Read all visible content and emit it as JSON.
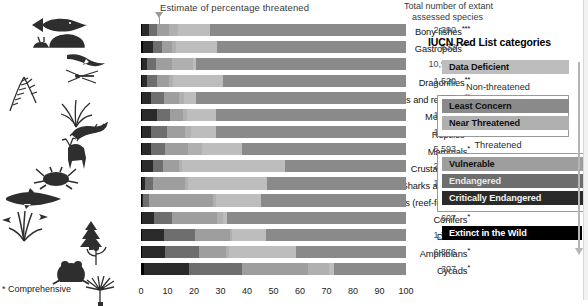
{
  "chart_title": "Estimate of percentage threatened",
  "totals_header_line1": "Total number of extant",
  "totals_header_line2": "assessed species",
  "footnote": "* Comprehensive",
  "legend": {
    "title": "IUCN Red List categories",
    "data_deficient": "Data Deficient",
    "non_threatened_label": "Non-threatened",
    "least_concern": "Least Concern",
    "near_threatened": "Near Threatened",
    "threatened_label": "Threatened",
    "vulnerable": "Vulnerable",
    "endangered": "Endangered",
    "critically_endangered": "Critically Endangered",
    "extinct_in_the_wild": "Extinct in the Wild"
  },
  "colors": {
    "data_deficient": "#bdbdbd",
    "least_concern": "#8a8a8a",
    "near_threatened": "#b0b0b0",
    "vulnerable": "#9e9e9e",
    "endangered": "#6e6e6e",
    "critically_endangered": "#2a2a2a",
    "extinct_in_the_wild": "#000000",
    "marker": "#9a9a9a",
    "background": "#ffffff"
  },
  "chart_data": {
    "type": "bar",
    "orientation": "horizontal",
    "stacked": true,
    "normalized_percent": true,
    "title": "Estimate of percentage threatened",
    "xlabel": "",
    "ylabel": "",
    "xlim": [
      0,
      100
    ],
    "xticks": [
      0,
      10,
      20,
      30,
      40,
      50,
      60,
      70,
      80,
      90,
      100
    ],
    "grid": false,
    "legend_position": "right",
    "threat_marker_percent": 7,
    "series": [
      {
        "name": "Extinct in the Wild",
        "key": "ew",
        "color": "#000000"
      },
      {
        "name": "Critically Endangered",
        "key": "cr",
        "color": "#2a2a2a"
      },
      {
        "name": "Endangered",
        "key": "en",
        "color": "#6e6e6e"
      },
      {
        "name": "Vulnerable",
        "key": "vu",
        "color": "#9e9e9e"
      },
      {
        "name": "Near Threatened",
        "key": "nt",
        "color": "#b0b0b0"
      },
      {
        "name": "Data Deficient",
        "key": "dd",
        "color": "#d6d6d6"
      },
      {
        "name": "Least Concern",
        "key": "lc",
        "color": "#8a8a8a"
      }
    ],
    "categories": [
      "Bony fishes",
      "Gastropods",
      "Birds",
      "Dragonflies",
      "Ferns and relatives",
      "Monocots",
      "Reptiles",
      "Mammals",
      "Crustaceans",
      "Sharks and rays",
      "Corals (reef-forming)",
      "Conifers",
      "Dicots",
      "Amphibians",
      "Cycads"
    ],
    "rows": [
      {
        "label": "Bony fishes",
        "stars": "***",
        "total": "2,390",
        "ew": 0.4,
        "cr": 2.5,
        "en": 3.0,
        "vu": 4.5,
        "nt": 3.5,
        "dd": 12.0,
        "lc": 74.1
      },
      {
        "label": "Gastropods",
        "stars": "***",
        "total": "633",
        "ew": 0.6,
        "cr": 4.0,
        "en": 3.5,
        "vu": 3.5,
        "nt": 1.5,
        "dd": 15.5,
        "lc": 71.4
      },
      {
        "label": "Birds",
        "stars": "*",
        "total": "10,966",
        "ew": 0.3,
        "cr": 1.8,
        "en": 3.6,
        "vu": 6.0,
        "nt": 8.0,
        "dd": 1.0,
        "lc": 79.3
      },
      {
        "label": "Dragonflies",
        "stars": "**",
        "total": "1,520",
        "ew": 0.2,
        "cr": 2.0,
        "en": 3.8,
        "vu": 4.5,
        "nt": 1.5,
        "dd": 19.0,
        "lc": 69.0
      },
      {
        "label": "Ferns and relatives",
        "stars": "**",
        "total": "972",
        "ew": 0.3,
        "cr": 3.5,
        "en": 5.0,
        "vu": 5.5,
        "nt": 2.0,
        "dd": 4.5,
        "lc": 79.2
      },
      {
        "label": "Monocots",
        "stars": "**",
        "total": "1,026",
        "ew": 0.5,
        "cr": 5.5,
        "en": 5.0,
        "vu": 5.0,
        "nt": 1.5,
        "dd": 11.0,
        "lc": 71.5
      },
      {
        "label": "Reptiles",
        "stars": "**",
        "total": "1,500",
        "ew": 0.3,
        "cr": 3.5,
        "en": 6.0,
        "vu": 7.0,
        "nt": 2.0,
        "dd": 9.5,
        "lc": 71.7
      },
      {
        "label": "Mammals",
        "stars": "*",
        "total": "5,593",
        "ew": 0.2,
        "cr": 3.5,
        "en": 5.5,
        "vu": 8.5,
        "nt": 5.5,
        "dd": 15.0,
        "lc": 61.8
      },
      {
        "label": "Crustaceans",
        "stars": "***",
        "total": "2,872",
        "ew": 0.4,
        "cr": 4.0,
        "en": 4.0,
        "vu": 6.0,
        "nt": 1.0,
        "dd": 39.0,
        "lc": 45.6
      },
      {
        "label": "Sharks and rays",
        "stars": "*",
        "total": "1,091",
        "ew": 0.2,
        "cr": 1.5,
        "en": 3.0,
        "vu": 12.0,
        "nt": 1.0,
        "dd": 30.0,
        "lc": 52.3
      },
      {
        "label": "Corals (reef-forming)",
        "stars": "*",
        "total": "845",
        "ew": 0.2,
        "cr": 0.5,
        "en": 2.5,
        "vu": 24.0,
        "nt": 1.0,
        "dd": 17.0,
        "lc": 54.8
      },
      {
        "label": "Conifers",
        "stars": "*",
        "total": "607",
        "ew": 0.3,
        "cr": 4.5,
        "en": 7.0,
        "vu": 17.0,
        "nt": 2.0,
        "dd": 1.5,
        "lc": 67.7
      },
      {
        "label": "Dicots",
        "stars": "***",
        "total": "1,781",
        "ew": 0.5,
        "cr": 8.0,
        "en": 12.0,
        "vu": 13.0,
        "nt": 1.0,
        "dd": 12.5,
        "lc": 53.0
      },
      {
        "label": "Amphibians",
        "stars": "*",
        "total": "6,576",
        "ew": 0.4,
        "cr": 8.5,
        "en": 13.0,
        "vu": 10.0,
        "nt": 1.5,
        "dd": 25.0,
        "lc": 41.6
      },
      {
        "label": "Cycads",
        "stars": "*",
        "total": "307",
        "ew": 1.0,
        "cr": 17.0,
        "en": 20.0,
        "vu": 25.0,
        "nt": 8.0,
        "dd": 2.0,
        "lc": 27.0
      }
    ]
  }
}
